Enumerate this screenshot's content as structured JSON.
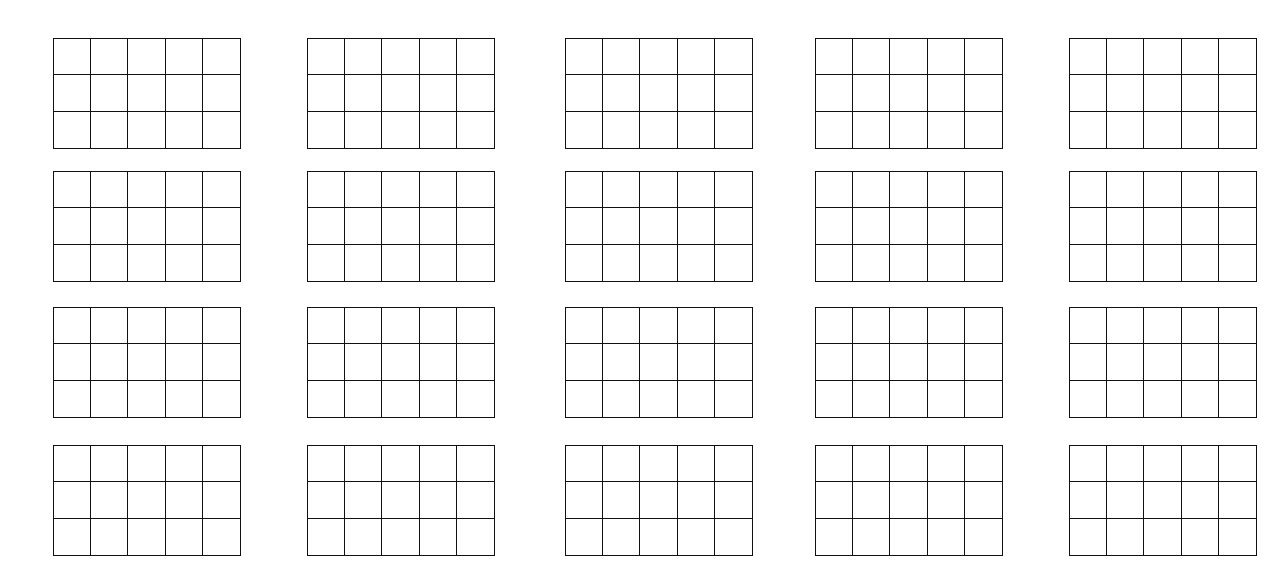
{
  "page": {
    "background": "#ffffff",
    "line_color": "#111111"
  },
  "layout": {
    "grid_rows": 3,
    "grid_cols": 5,
    "col_x": [
      53,
      307,
      565,
      815,
      1069
    ],
    "row_y": [
      38,
      171,
      307,
      445
    ],
    "grid_width": 188,
    "grid_height": 111
  },
  "grids": [
    {
      "id": "r1c1"
    },
    {
      "id": "r1c2"
    },
    {
      "id": "r1c3"
    },
    {
      "id": "r1c4"
    },
    {
      "id": "r1c5"
    },
    {
      "id": "r2c1"
    },
    {
      "id": "r2c2"
    },
    {
      "id": "r2c3"
    },
    {
      "id": "r2c4"
    },
    {
      "id": "r2c5"
    },
    {
      "id": "r3c1"
    },
    {
      "id": "r3c2"
    },
    {
      "id": "r3c3"
    },
    {
      "id": "r3c4"
    },
    {
      "id": "r3c5"
    },
    {
      "id": "r4c1"
    },
    {
      "id": "r4c2"
    },
    {
      "id": "r4c3"
    },
    {
      "id": "r4c4"
    },
    {
      "id": "r4c5"
    }
  ]
}
